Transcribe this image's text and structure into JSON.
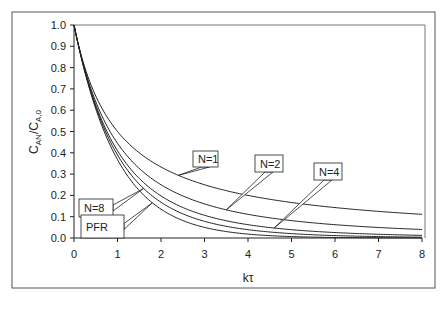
{
  "chart_data": {
    "type": "line",
    "title": "",
    "xlabel": "kτ",
    "ylabel": "C_AN/C_A,0",
    "ylabel_parts": {
      "main": "C",
      "sub1": "AN",
      "slash": "/C",
      "sub2": "A,0"
    },
    "xlim": [
      0,
      8
    ],
    "ylim": [
      0,
      1.0
    ],
    "x_ticks": [
      0,
      1,
      2,
      3,
      4,
      5,
      6,
      7,
      8
    ],
    "y_ticks": [
      0.0,
      0.1,
      0.2,
      0.3,
      0.4,
      0.5,
      0.6,
      0.7,
      0.8,
      0.9,
      1.0
    ],
    "y_tick_labels": [
      "0.0",
      "0.1",
      "0.2",
      "0.3",
      "0.4",
      "0.5",
      "0.6",
      "0.7",
      "0.8",
      "0.9",
      "1.0"
    ],
    "x_tick_labels": [
      "0",
      "1",
      "2",
      "3",
      "4",
      "5",
      "6",
      "7",
      "8"
    ],
    "grid": false,
    "legend": "callout labels on curves",
    "x": [
      0,
      0.5,
      1,
      1.5,
      2,
      2.5,
      3,
      3.5,
      4,
      4.5,
      5,
      5.5,
      6,
      6.5,
      7,
      7.5,
      8
    ],
    "series": [
      {
        "name": "N=1",
        "values": [
          1.0,
          0.667,
          0.5,
          0.4,
          0.333,
          0.286,
          0.25,
          0.222,
          0.2,
          0.182,
          0.167,
          0.154,
          0.143,
          0.133,
          0.125,
          0.118,
          0.111
        ]
      },
      {
        "name": "N=2",
        "values": [
          1.0,
          0.64,
          0.444,
          0.327,
          0.25,
          0.198,
          0.16,
          0.132,
          0.111,
          0.095,
          0.082,
          0.071,
          0.063,
          0.055,
          0.049,
          0.044,
          0.04
        ]
      },
      {
        "name": "N=4",
        "values": [
          1.0,
          0.624,
          0.41,
          0.281,
          0.198,
          0.143,
          0.105,
          0.079,
          0.0625,
          0.047,
          0.037,
          0.029,
          0.023,
          0.018,
          0.015,
          0.012,
          0.0123
        ]
      },
      {
        "name": "N=8",
        "values": [
          1.0,
          0.616,
          0.392,
          0.258,
          0.172,
          0.118,
          0.082,
          0.058,
          0.039,
          0.029,
          0.021,
          0.015,
          0.011,
          0.008,
          0.006,
          0.005,
          0.0039
        ]
      },
      {
        "name": "PFR",
        "values": [
          1.0,
          0.607,
          0.368,
          0.223,
          0.135,
          0.082,
          0.05,
          0.03,
          0.018,
          0.011,
          0.007,
          0.004,
          0.0025,
          0.0015,
          0.0009,
          0.0006,
          0.0003
        ]
      }
    ],
    "callouts": [
      {
        "label": "N=1",
        "box": [
          193,
          151,
          25,
          16
        ],
        "target_x": 2.4
      },
      {
        "label": "N=2",
        "box": [
          255,
          155,
          28,
          17
        ],
        "target_x": 3.5
      },
      {
        "label": "N=4",
        "box": [
          314,
          163,
          28,
          17
        ],
        "target_x": 4.6
      },
      {
        "label": "N=8",
        "box": [
          79,
          199,
          34,
          18
        ],
        "target_x": 1.6
      },
      {
        "label": "PFR",
        "box": [
          81,
          215,
          43,
          23
        ],
        "target_x": 1.8
      }
    ]
  }
}
